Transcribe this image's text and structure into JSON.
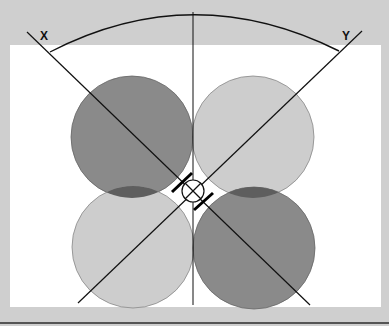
{
  "diagram": {
    "labels": {
      "x_axis": "X",
      "y_axis": "Y"
    },
    "colors": {
      "background": "#cfcfcf",
      "panel": "#ffffff",
      "lobe_dark": "#8a8a8a",
      "lobe_light": "#cdcdcd",
      "overlap": "#5e5e5e",
      "line": "#111111"
    },
    "lobes": [
      {
        "name": "front-left",
        "shade": "dark",
        "cx": 132,
        "cy": 137,
        "r": 61
      },
      {
        "name": "front-right",
        "shade": "light",
        "cx": 253,
        "cy": 137,
        "r": 61
      },
      {
        "name": "rear-left",
        "shade": "light",
        "cx": 133,
        "cy": 247,
        "r": 61
      },
      {
        "name": "rear-right",
        "shade": "dark",
        "cx": 254,
        "cy": 248,
        "r": 61
      }
    ],
    "center_capsule": {
      "cx": 193,
      "cy": 191,
      "r": 11
    }
  }
}
